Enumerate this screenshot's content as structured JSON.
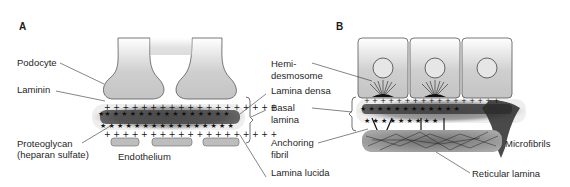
{
  "figure": {
    "panel_a": {
      "letter": "A",
      "labels": {
        "podocyte": "Podocyte",
        "laminin": "Laminin",
        "proteoglycan_1": "Proteoglycan",
        "proteoglycan_2": "(heparan sulfate)",
        "endothelium": "Endothelium",
        "lamina_densa": "Lamina densa",
        "basal_lamina_1": "Basal",
        "basal_lamina_2": "lamina",
        "lamina_lucida": "Lamina lucida"
      }
    },
    "panel_b": {
      "letter": "B",
      "labels": {
        "hemidesmosome_1": "Hemi-",
        "hemidesmosome_2": "desmosome",
        "anchoring_fibril_1": "Anchoring",
        "anchoring_fibril_2": "fibril",
        "microfibrils": "Microfibrils",
        "reticular_lamina": "Reticular lamina"
      }
    },
    "colors": {
      "cell_gray": "#c8c8c8",
      "lamina_dark": "#2a2a2a",
      "halo_gray": "#9a9a9a",
      "line": "#333333"
    }
  }
}
